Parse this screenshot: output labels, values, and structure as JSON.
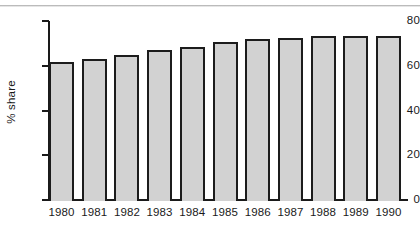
{
  "chart_data": {
    "type": "bar",
    "title": "",
    "subtitle": "",
    "xlabel": "",
    "ylabel": "% share",
    "categories": [
      "1980",
      "1981",
      "1982",
      "1983",
      "1984",
      "1985",
      "1986",
      "1987",
      "1988",
      "1989",
      "1990"
    ],
    "values": [
      61.5,
      63.0,
      65.0,
      67.0,
      68.5,
      70.5,
      72.0,
      72.5,
      73.5,
      73.5,
      73.5
    ],
    "series": [
      {
        "name": "% share",
        "values": [
          61.5,
          63.0,
          65.0,
          67.0,
          68.5,
          70.5,
          72.0,
          72.5,
          73.5,
          73.5,
          73.5
        ]
      }
    ],
    "ylim": [
      0,
      80
    ],
    "yticks": [
      0,
      20,
      40,
      60,
      80
    ],
    "ytick_labels": [
      "0",
      "20",
      "40",
      "60",
      "80"
    ],
    "grid": false,
    "legend": false,
    "legend_position": "none",
    "bar_fill_color": "#d2d2d2",
    "bar_edge_color": "#1c1c1c",
    "axis_color": "#1a1a1a",
    "background_color": "#ffffff"
  },
  "axis": {
    "y_label": "% share",
    "ticks": [
      {
        "label": "80",
        "value": 80
      },
      {
        "label": "60",
        "value": 60
      },
      {
        "label": "40",
        "value": 40
      },
      {
        "label": "20",
        "value": 20
      },
      {
        "label": "0",
        "value": 0
      }
    ]
  },
  "bars": [
    {
      "year": "1980",
      "value": 61.5
    },
    {
      "year": "1981",
      "value": 63.0
    },
    {
      "year": "1982",
      "value": 65.0
    },
    {
      "year": "1983",
      "value": 67.0
    },
    {
      "year": "1984",
      "value": 68.5
    },
    {
      "year": "1985",
      "value": 70.5
    },
    {
      "year": "1986",
      "value": 72.0
    },
    {
      "year": "1987",
      "value": 72.5
    },
    {
      "year": "1988",
      "value": 73.5
    },
    {
      "year": "1989",
      "value": 73.5
    },
    {
      "year": "1990",
      "value": 73.5
    }
  ]
}
